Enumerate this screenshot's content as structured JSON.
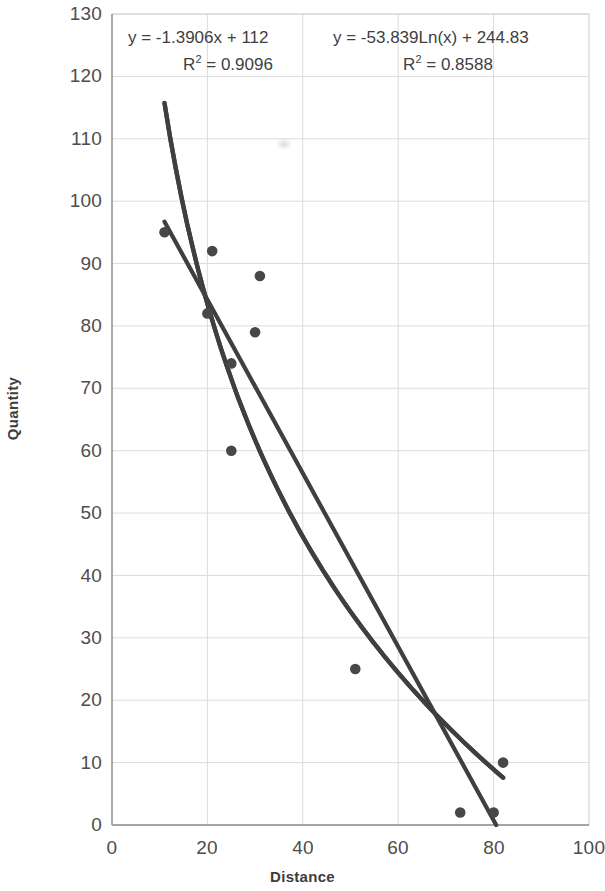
{
  "chart_data": {
    "type": "scatter",
    "title": "",
    "xlabel": "Distance",
    "ylabel": "Quantity",
    "xlim": [
      0,
      100
    ],
    "ylim": [
      0,
      130
    ],
    "xticks": [
      0,
      20,
      40,
      60,
      80,
      100
    ],
    "yticks": [
      0,
      10,
      20,
      30,
      40,
      50,
      60,
      70,
      80,
      90,
      100,
      110,
      120,
      130
    ],
    "grid": true,
    "legend": "none",
    "points": [
      {
        "x": 11,
        "y": 95
      },
      {
        "x": 21,
        "y": 92
      },
      {
        "x": 31,
        "y": 88
      },
      {
        "x": 20,
        "y": 82
      },
      {
        "x": 30,
        "y": 79
      },
      {
        "x": 25,
        "y": 74
      },
      {
        "x": 25,
        "y": 60
      },
      {
        "x": 51,
        "y": 25
      },
      {
        "x": 82,
        "y": 10
      },
      {
        "x": 73,
        "y": 2
      },
      {
        "x": 80,
        "y": 2
      }
    ],
    "series": [
      {
        "name": "linear-trendline",
        "type": "line",
        "equation": "y = -1.3906x + 112",
        "r_squared": "R² = 0.9096",
        "slope": -1.3906,
        "intercept": 112,
        "x_start": 11,
        "x_end": 82
      },
      {
        "name": "logarithmic-trendline",
        "type": "line",
        "equation": "y = -53.839Ln(x) + 244.83",
        "r_squared": "R² = 0.8588",
        "coefficient": -53.839,
        "constant": 244.83,
        "x_start": 11,
        "x_end": 82
      }
    ],
    "annotations": {
      "linear": {
        "equation_prefix": "y = -1.3906x + 112",
        "r2_label": "R",
        "r2_exp": "2",
        "r2_value": " = 0.9096"
      },
      "logarithmic": {
        "equation_prefix": "y = -53.839Ln(x) + 244.83",
        "r2_label": "R",
        "r2_exp": "2",
        "r2_value": " = 0.8588"
      }
    },
    "colors": {
      "marker": "#4a4a4a",
      "trendline": "#3f3f3f",
      "grid": "#d9d9d9",
      "axis": "#9a9a9a",
      "text": "#4d4d4d"
    }
  }
}
